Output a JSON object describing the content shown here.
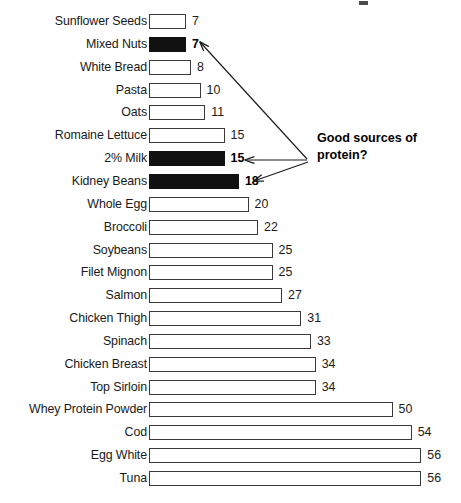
{
  "chart_data": {
    "type": "bar",
    "orientation": "horizontal",
    "title": "",
    "subtitle": "",
    "xlabel": "",
    "ylabel": "",
    "xlim": [
      0,
      56
    ],
    "grid": false,
    "legend": null,
    "value_label_position": "outside-end",
    "categories": [
      "Sunflower Seeds",
      "Mixed Nuts",
      "White Bread",
      "Pasta",
      "Oats",
      "Romaine Lettuce",
      "2% Milk",
      "Kidney Beans",
      "Whole Egg",
      "Broccoli",
      "Soybeans",
      "Filet Mignon",
      "Salmon",
      "Chicken Thigh",
      "Spinach",
      "Chicken Breast",
      "Top Sirloin",
      "Whey Protein Powder",
      "Cod",
      "Egg White",
      "Tuna"
    ],
    "values": [
      7,
      7,
      8,
      10,
      11,
      15,
      15,
      18,
      20,
      22,
      25,
      25,
      27,
      31,
      33,
      34,
      34,
      50,
      54,
      56,
      56
    ],
    "highlighted": [
      false,
      true,
      false,
      false,
      false,
      false,
      true,
      true,
      false,
      false,
      false,
      false,
      false,
      false,
      false,
      false,
      false,
      false,
      false,
      false,
      false
    ],
    "colors": {
      "bar_fill": "#ffffff",
      "bar_stroke": "#3a3a3a",
      "highlight_fill": "#111111",
      "text": "#1a1a1a",
      "annotation": "#000000"
    },
    "annotations": [
      {
        "text_lines": [
          "Good sources of",
          "protein?"
        ],
        "points_to": [
          "Mixed Nuts",
          "2% Milk",
          "Kidney Beans"
        ]
      }
    ]
  },
  "annotation": {
    "line1": "Good sources of",
    "line2": "protein?"
  }
}
